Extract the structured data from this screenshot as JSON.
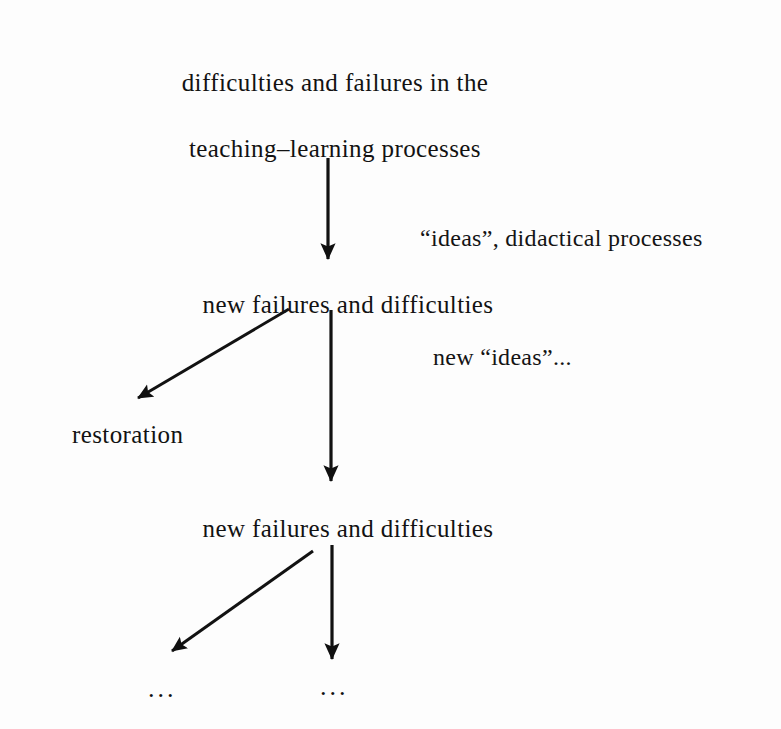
{
  "figure": {
    "background_color": "#fdfdfd",
    "ink_color": "#121212"
  },
  "nodes": [
    {
      "id": "root-line-1",
      "text": "difficulties and failures in the",
      "x": 335,
      "y": 70
    },
    {
      "id": "root-line-2",
      "text": "teaching–learning processes",
      "x": 335,
      "y": 136
    },
    {
      "id": "second-stage",
      "text": "new failures and difficulties",
      "x": 348,
      "y": 292
    },
    {
      "id": "restoration",
      "text": "restoration",
      "x": 72,
      "y": 422
    },
    {
      "id": "third-stage",
      "text": "new failures and difficulties",
      "x": 348,
      "y": 516
    }
  ],
  "edge_labels": [
    {
      "id": "ideas-didactical",
      "text": "“ideas”, didactical processes",
      "x": 420,
      "y": 226
    },
    {
      "id": "new-ideas",
      "text": "new “ideas”...",
      "x": 433,
      "y": 345
    }
  ],
  "ellipses": [
    {
      "id": "ellipsis-left",
      "text": "...",
      "x": 148,
      "y": 676
    },
    {
      "id": "ellipsis-right",
      "text": "...",
      "x": 320,
      "y": 674
    }
  ],
  "arrows": [
    {
      "id": "arrow-root-to-second",
      "kind": "vertical",
      "from": [
        328,
        158
      ],
      "to": [
        328,
        259
      ]
    },
    {
      "id": "arrow-second-to-restoration",
      "kind": "diagonal",
      "from": [
        289,
        309
      ],
      "to": [
        138,
        398
      ]
    },
    {
      "id": "arrow-second-to-third",
      "kind": "vertical",
      "from": [
        331,
        310
      ],
      "to": [
        331,
        481
      ]
    },
    {
      "id": "arrow-third-to-ellipsis-left",
      "kind": "diagonal",
      "from": [
        313,
        551
      ],
      "to": [
        172,
        651
      ]
    },
    {
      "id": "arrow-third-to-ellipsis-right",
      "kind": "vertical",
      "from": [
        332,
        545
      ],
      "to": [
        332,
        659
      ]
    }
  ]
}
